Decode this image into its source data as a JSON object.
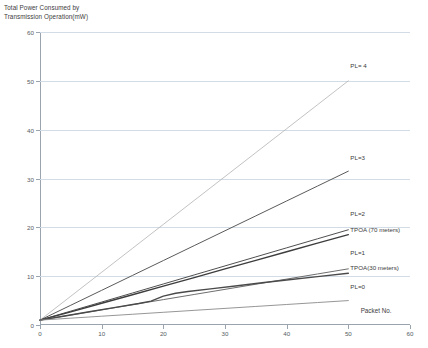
{
  "chart_data": {
    "type": "line",
    "title": "",
    "ylabel": "Total Power Consumed by\nTransmission Operation(mW)",
    "xlabel": "Packet No.",
    "xlim": [
      0,
      60
    ],
    "ylim": [
      0,
      60
    ],
    "xticks": [
      0,
      10,
      20,
      30,
      40,
      50,
      60
    ],
    "yticks": [
      0,
      10,
      20,
      30,
      40,
      50,
      60
    ],
    "xtick_labels": [
      "0",
      "10",
      "20",
      "30",
      "40",
      "50",
      "60"
    ],
    "ytick_labels": [
      "0",
      "10",
      "20",
      "30",
      "40",
      "50",
      "60"
    ],
    "grid": "horizontal",
    "legend": "inline-right-labels",
    "series": [
      {
        "name": "PL= 4",
        "color": "#b3b3b3",
        "width": 0.8,
        "label_x": 50,
        "label_y": 53.2,
        "x": [
          0,
          5,
          10,
          15,
          20,
          25,
          30,
          35,
          40,
          45,
          50
        ],
        "y": [
          1.0,
          5.9,
          10.8,
          15.7,
          20.6,
          25.5,
          30.4,
          35.3,
          40.2,
          45.1,
          50.0
        ]
      },
      {
        "name": "PL=3",
        "color": "#5a5a5a",
        "width": 1.0,
        "label_x": 50,
        "label_y": 34.5,
        "x": [
          0,
          5,
          10,
          15,
          20,
          25,
          30,
          35,
          40,
          45,
          50
        ],
        "y": [
          1.0,
          4.05,
          7.1,
          10.15,
          13.2,
          16.25,
          19.3,
          22.35,
          25.4,
          28.45,
          31.5
        ]
      },
      {
        "name": "PL=2",
        "color": "#4f4f4f",
        "width": 1.0,
        "label_x": 50,
        "label_y": 23.0,
        "x": [
          0,
          5,
          10,
          15,
          20,
          25,
          30,
          35,
          40,
          45,
          50
        ],
        "y": [
          1.0,
          2.85,
          4.7,
          6.55,
          8.4,
          10.25,
          12.1,
          13.95,
          15.8,
          17.65,
          19.5
        ]
      },
      {
        "name": "TPOA (70 meters)",
        "color": "#3d3d3d",
        "width": 1.4,
        "label_x": 50,
        "label_y": 19.6,
        "x": [
          0,
          5,
          10,
          15,
          20,
          25,
          30,
          35,
          40,
          45,
          50
        ],
        "y": [
          1.0,
          2.7,
          4.45,
          6.2,
          7.95,
          9.7,
          11.5,
          13.25,
          15.0,
          16.75,
          18.5
        ]
      },
      {
        "name": "PL=1",
        "color": "#6e6e6e",
        "width": 1.0,
        "label_x": 50,
        "label_y": 14.9,
        "x": [
          0,
          5,
          10,
          15,
          20,
          25,
          30,
          35,
          40,
          45,
          50
        ],
        "y": [
          1.0,
          2.05,
          3.1,
          4.15,
          5.2,
          6.25,
          7.3,
          8.35,
          9.4,
          10.45,
          11.5
        ]
      },
      {
        "name": "TPOA(30 meters)",
        "color": "#4a4a4a",
        "width": 1.4,
        "label_x": 50,
        "label_y": 11.9,
        "x": [
          0,
          4,
          8,
          12,
          16,
          18,
          20,
          22,
          24,
          28,
          32,
          36,
          40,
          45,
          50
        ],
        "y": [
          1.0,
          1.85,
          2.7,
          3.55,
          4.4,
          4.9,
          5.9,
          6.5,
          6.85,
          7.45,
          8.05,
          8.65,
          9.2,
          9.9,
          10.6
        ]
      },
      {
        "name": "PL=0",
        "color": "#8a8a8a",
        "width": 0.9,
        "label_x": 50,
        "label_y": 8.0,
        "x": [
          0,
          5,
          10,
          15,
          20,
          25,
          30,
          35,
          40,
          45,
          50
        ],
        "y": [
          1.0,
          1.4,
          1.8,
          2.2,
          2.6,
          3.0,
          3.4,
          3.8,
          4.2,
          4.6,
          5.0
        ]
      }
    ]
  }
}
